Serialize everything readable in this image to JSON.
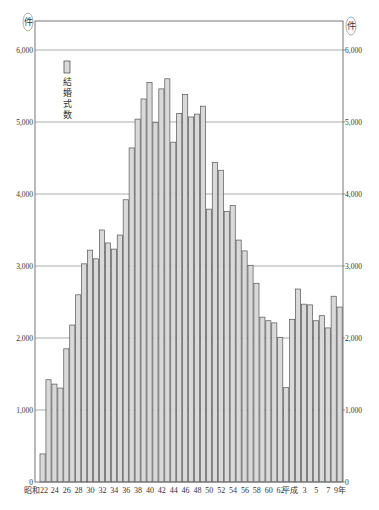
{
  "chart_data": {
    "type": "bar",
    "title": "",
    "xlabel": "",
    "ylabel": "(件)",
    "ylabel_right": "(件)",
    "ylim": [
      0,
      6000
    ],
    "yticks": [
      0,
      1000,
      2000,
      3000,
      4000,
      5000,
      6000
    ],
    "ytick_labels": [
      "0",
      "1,000",
      "2,000",
      "3,000",
      "4,000",
      "5,000",
      "6,000"
    ],
    "grid": true,
    "legend": {
      "label": "結婚式数",
      "position": "upper-left"
    },
    "x_tick_labels": [
      {
        "index": 0,
        "text": "昭和22"
      },
      {
        "index": 2,
        "text": "24"
      },
      {
        "index": 4,
        "text": "26"
      },
      {
        "index": 6,
        "text": "28"
      },
      {
        "index": 8,
        "text": "30"
      },
      {
        "index": 10,
        "text": "32"
      },
      {
        "index": 12,
        "text": "34"
      },
      {
        "index": 14,
        "text": "36"
      },
      {
        "index": 16,
        "text": "38"
      },
      {
        "index": 18,
        "text": "40"
      },
      {
        "index": 20,
        "text": "42"
      },
      {
        "index": 22,
        "text": "44"
      },
      {
        "index": 24,
        "text": "46"
      },
      {
        "index": 26,
        "text": "48"
      },
      {
        "index": 28,
        "text": "50"
      },
      {
        "index": 30,
        "text": "52"
      },
      {
        "index": 32,
        "text": "54"
      },
      {
        "index": 34,
        "text": "56"
      },
      {
        "index": 36,
        "text": "58"
      },
      {
        "index": 38,
        "text": "60"
      },
      {
        "index": 40,
        "text": "62"
      },
      {
        "index": 41.6,
        "text": "平成"
      },
      {
        "index": 44,
        "text": "3"
      },
      {
        "index": 46,
        "text": "5"
      },
      {
        "index": 48,
        "text": "7"
      },
      {
        "index": 50,
        "text": "9年"
      }
    ],
    "categories": [
      "昭和22",
      "昭和23",
      "昭和24",
      "昭和25",
      "昭和26",
      "昭和27",
      "昭和28",
      "昭和29",
      "昭和30",
      "昭和31",
      "昭和32",
      "昭和33",
      "昭和34",
      "昭和35",
      "昭和36",
      "昭和37",
      "昭和38",
      "昭和39",
      "昭和40",
      "昭和41",
      "昭和42",
      "昭和43",
      "昭和44",
      "昭和45",
      "昭和46",
      "昭和47",
      "昭和48",
      "昭和49",
      "昭和50",
      "昭和51",
      "昭和52",
      "昭和53",
      "昭和54",
      "昭和55",
      "昭和56",
      "昭和57",
      "昭和58",
      "昭和59",
      "昭和60",
      "昭和61",
      "昭和62",
      "昭和63",
      "平成1",
      "平成2",
      "平成3",
      "平成4",
      "平成5",
      "平成6",
      "平成7",
      "平成8",
      "平成9"
    ],
    "series": [
      {
        "name": "結婚式数",
        "color": "#d9d9d9",
        "edge_color": "#555555",
        "values": [
          390,
          1420,
          1360,
          1305,
          1850,
          2180,
          2600,
          3030,
          3220,
          3100,
          3500,
          3320,
          3235,
          3430,
          3920,
          4640,
          5040,
          5320,
          5550,
          4990,
          5460,
          5600,
          4720,
          5120,
          5380,
          5070,
          5110,
          5220,
          3790,
          4440,
          4330,
          3760,
          3840,
          3360,
          3210,
          3010,
          2760,
          2290,
          2240,
          2210,
          2010,
          1310,
          2260,
          2680,
          2470,
          2460,
          2240,
          2310,
          2140,
          2580,
          2430
        ]
      }
    ]
  },
  "colors": {
    "bar_fill": "#d9d9d9",
    "bar_edge": "#555555",
    "axis": "#666666",
    "grid": "#888888",
    "text": "#333333"
  }
}
